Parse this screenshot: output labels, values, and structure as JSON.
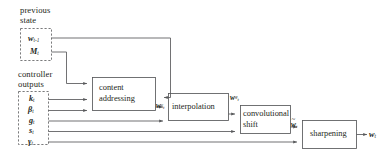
{
  "diagram": {
    "stroke_color": "#58595b",
    "text_color": "#231f20",
    "background": "#ffffff",
    "groups": [
      {
        "id": "previous-state",
        "label": "previous\nstate"
      },
      {
        "id": "controller-outputs",
        "label": "controller\noutputs"
      }
    ],
    "previous_state_signals": [
      {
        "id": "w-prev",
        "base": "w",
        "sub": "t-1",
        "sup": ""
      },
      {
        "id": "m-t",
        "base": "M",
        "sub": "t",
        "sup": ""
      }
    ],
    "controller_output_signals": [
      {
        "id": "k-t",
        "base": "k",
        "sub": "t",
        "sup": ""
      },
      {
        "id": "beta-t",
        "base": "β",
        "sub": "t",
        "sup": ""
      },
      {
        "id": "g-t",
        "base": "g",
        "sub": "t",
        "sup": ""
      },
      {
        "id": "s-t",
        "base": "s",
        "sub": "t",
        "sup": ""
      },
      {
        "id": "gamma-t",
        "base": "γ",
        "sub": "t",
        "sup": ""
      }
    ],
    "process_boxes": [
      {
        "id": "content-addressing",
        "label": "content\naddressing"
      },
      {
        "id": "interpolation",
        "label": "interpolation"
      },
      {
        "id": "convolutional-shift",
        "label": "convolutional\nshift"
      },
      {
        "id": "sharpening",
        "label": "sharpening"
      }
    ],
    "intermediate_signals": [
      {
        "id": "w-c",
        "base": "w",
        "sub": "t",
        "sup": "c",
        "after": "content-addressing"
      },
      {
        "id": "w-g",
        "base": "w",
        "sub": "t",
        "sup": "g",
        "after": "interpolation"
      },
      {
        "id": "w-tilde",
        "base": "w",
        "sub": "t",
        "sup": "",
        "tilde": "~",
        "after": "convolutional-shift"
      }
    ],
    "output_signal": {
      "id": "w-t",
      "base": "w",
      "sub": "t",
      "sup": ""
    }
  }
}
